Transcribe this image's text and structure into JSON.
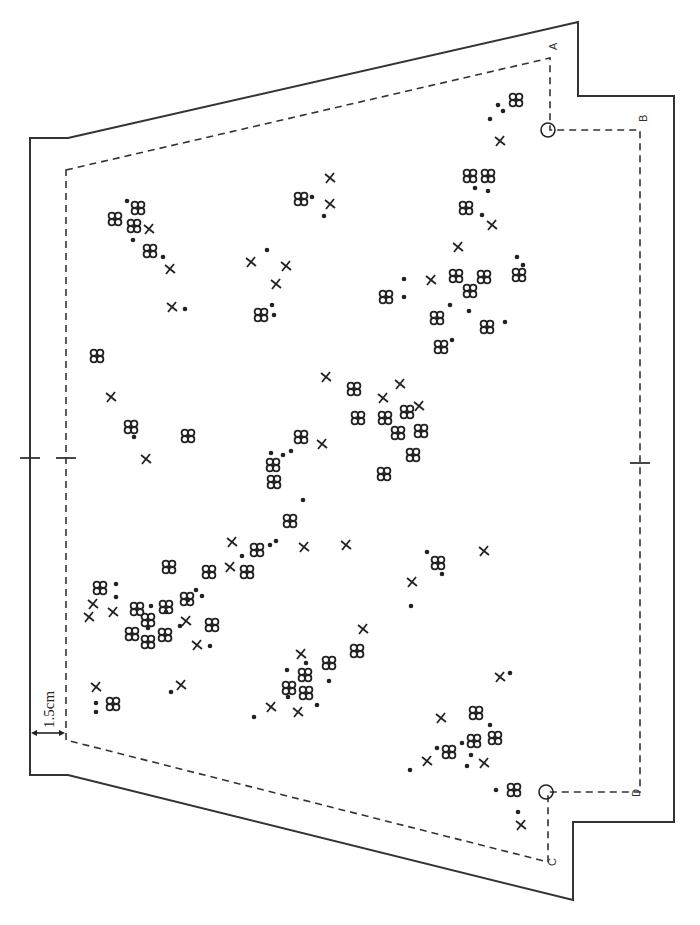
{
  "diagram": {
    "type": "site-plan",
    "scale_label": "1.5cm",
    "corner_labels": [
      {
        "id": "A",
        "x": 557,
        "y": 50
      },
      {
        "id": "B",
        "x": 647,
        "y": 122
      },
      {
        "id": "C",
        "x": 556,
        "y": 866
      },
      {
        "id": "D",
        "x": 640,
        "y": 797
      }
    ],
    "legend_symbols": [
      {
        "name": "clover",
        "description": "four small circles"
      },
      {
        "name": "dot",
        "description": "filled dot"
      },
      {
        "name": "cross",
        "description": "x mark"
      }
    ],
    "outer_boundary": [
      [
        30,
        138
      ],
      [
        68,
        138
      ],
      [
        578,
        22
      ],
      [
        578,
        96
      ],
      [
        674,
        96
      ],
      [
        674,
        822
      ],
      [
        573,
        822
      ],
      [
        573,
        900
      ],
      [
        68,
        775
      ],
      [
        30,
        775
      ]
    ],
    "inner_boundary": [
      [
        66,
        170
      ],
      [
        550,
        58
      ],
      [
        550,
        130
      ],
      [
        640,
        130
      ],
      [
        640,
        792
      ],
      [
        548,
        792
      ],
      [
        548,
        862
      ],
      [
        66,
        740
      ]
    ],
    "pins": [
      {
        "x": 548,
        "y": 130
      },
      {
        "x": 546,
        "y": 792
      }
    ],
    "center_ticks": [
      {
        "x": 30,
        "y": 458
      },
      {
        "x": 66,
        "y": 458
      },
      {
        "x": 640,
        "y": 463
      }
    ],
    "clovers": [
      [
        138,
        208
      ],
      [
        115,
        219
      ],
      [
        134,
        226
      ],
      [
        150,
        251
      ],
      [
        516,
        100
      ],
      [
        470,
        176
      ],
      [
        488,
        176
      ],
      [
        466,
        208
      ],
      [
        301,
        199
      ],
      [
        261,
        315
      ],
      [
        386,
        297
      ],
      [
        456,
        276
      ],
      [
        484,
        277
      ],
      [
        437,
        318
      ],
      [
        470,
        291
      ],
      [
        487,
        327
      ],
      [
        519,
        275
      ],
      [
        441,
        347
      ],
      [
        97,
        356
      ],
      [
        131,
        427
      ],
      [
        188,
        436
      ],
      [
        354,
        389
      ],
      [
        358,
        418
      ],
      [
        385,
        418
      ],
      [
        407,
        412
      ],
      [
        398,
        433
      ],
      [
        421,
        431
      ],
      [
        413,
        455
      ],
      [
        384,
        474
      ],
      [
        301,
        437
      ],
      [
        273,
        465
      ],
      [
        274,
        482
      ],
      [
        290,
        521
      ],
      [
        438,
        563
      ],
      [
        100,
        588
      ],
      [
        169,
        567
      ],
      [
        137,
        609
      ],
      [
        209,
        572
      ],
      [
        166,
        607
      ],
      [
        148,
        620
      ],
      [
        187,
        599
      ],
      [
        132,
        634
      ],
      [
        148,
        642
      ],
      [
        165,
        635
      ],
      [
        212,
        625
      ],
      [
        113,
        704
      ],
      [
        257,
        550
      ],
      [
        247,
        572
      ],
      [
        329,
        663
      ],
      [
        357,
        651
      ],
      [
        289,
        688
      ],
      [
        305,
        675
      ],
      [
        306,
        693
      ],
      [
        476,
        713
      ],
      [
        474,
        741
      ],
      [
        495,
        738
      ],
      [
        449,
        752
      ],
      [
        514,
        790
      ]
    ],
    "dots": [
      [
        127,
        201
      ],
      [
        133,
        240
      ],
      [
        163,
        257
      ],
      [
        185,
        309
      ],
      [
        498,
        105
      ],
      [
        503,
        111
      ],
      [
        490,
        119
      ],
      [
        475,
        188
      ],
      [
        488,
        191
      ],
      [
        482,
        215
      ],
      [
        312,
        197
      ],
      [
        324,
        216
      ],
      [
        267,
        250
      ],
      [
        272,
        305
      ],
      [
        274,
        315
      ],
      [
        404,
        279
      ],
      [
        404,
        297
      ],
      [
        450,
        305
      ],
      [
        469,
        311
      ],
      [
        505,
        322
      ],
      [
        452,
        340
      ],
      [
        517,
        257
      ],
      [
        523,
        265
      ],
      [
        134,
        437
      ],
      [
        271,
        453
      ],
      [
        283,
        455
      ],
      [
        291,
        451
      ],
      [
        303,
        500
      ],
      [
        276,
        541
      ],
      [
        116,
        584
      ],
      [
        116,
        597
      ],
      [
        151,
        606
      ],
      [
        166,
        612
      ],
      [
        196,
        590
      ],
      [
        202,
        596
      ],
      [
        148,
        628
      ],
      [
        180,
        626
      ],
      [
        188,
        600
      ],
      [
        210,
        646
      ],
      [
        171,
        692
      ],
      [
        427,
        552
      ],
      [
        442,
        574
      ],
      [
        411,
        606
      ],
      [
        242,
        556
      ],
      [
        270,
        545
      ],
      [
        96,
        703
      ],
      [
        96,
        712
      ],
      [
        254,
        717
      ],
      [
        287,
        670
      ],
      [
        329,
        681
      ],
      [
        306,
        663
      ],
      [
        288,
        697
      ],
      [
        317,
        705
      ],
      [
        490,
        725
      ],
      [
        410,
        770
      ],
      [
        437,
        748
      ],
      [
        462,
        743
      ],
      [
        471,
        755
      ],
      [
        467,
        766
      ],
      [
        510,
        673
      ],
      [
        496,
        790
      ],
      [
        518,
        812
      ]
    ],
    "crosses": [
      [
        149,
        229
      ],
      [
        170,
        269
      ],
      [
        172,
        307
      ],
      [
        500,
        141
      ],
      [
        492,
        225
      ],
      [
        458,
        247
      ],
      [
        431,
        280
      ],
      [
        330,
        178
      ],
      [
        330,
        204
      ],
      [
        251,
        262
      ],
      [
        286,
        266
      ],
      [
        276,
        284
      ],
      [
        326,
        377
      ],
      [
        383,
        398
      ],
      [
        400,
        384
      ],
      [
        419,
        406
      ],
      [
        322,
        444
      ],
      [
        111,
        397
      ],
      [
        146,
        459
      ],
      [
        304,
        547
      ],
      [
        346,
        545
      ],
      [
        484,
        551
      ],
      [
        412,
        582
      ],
      [
        232,
        542
      ],
      [
        230,
        567
      ],
      [
        89,
        617
      ],
      [
        93,
        604
      ],
      [
        113,
        612
      ],
      [
        186,
        621
      ],
      [
        197,
        645
      ],
      [
        96,
        687
      ],
      [
        181,
        685
      ],
      [
        363,
        629
      ],
      [
        301,
        654
      ],
      [
        271,
        707
      ],
      [
        298,
        712
      ],
      [
        441,
        718
      ],
      [
        427,
        761
      ],
      [
        484,
        763
      ],
      [
        500,
        677
      ],
      [
        521,
        825
      ]
    ]
  }
}
